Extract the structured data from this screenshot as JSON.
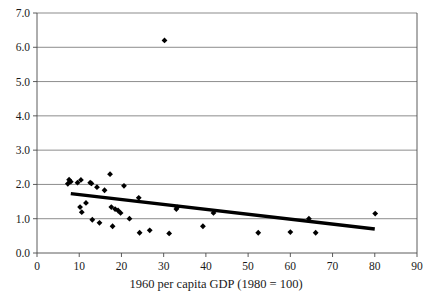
{
  "chart_data": {
    "type": "scatter",
    "title": "",
    "xlabel": "1960 per capita GDP (1980 = 100)",
    "ylabel": "",
    "xlim": [
      0,
      90
    ],
    "ylim": [
      0,
      7
    ],
    "xticks": [
      0,
      10,
      20,
      30,
      40,
      50,
      60,
      70,
      80,
      90
    ],
    "xtick_labels": [
      "0",
      "10",
      "20",
      "30",
      "40",
      "50",
      "60",
      "70",
      "80",
      "90"
    ],
    "yticks": [
      0,
      1,
      2,
      3,
      4,
      5,
      6,
      7
    ],
    "ytick_labels": [
      "0.0",
      "1.0",
      "2.0",
      "3.0",
      "4.0",
      "5.0",
      "6.0",
      "7.0"
    ],
    "grid": "horizontal",
    "legend": "none",
    "marker_style": "filled-diamond",
    "marker_color": "#000000",
    "points": [
      {
        "x": 7.3,
        "y": 2.02
      },
      {
        "x": 7.6,
        "y": 2.14
      },
      {
        "x": 8.0,
        "y": 2.08
      },
      {
        "x": 9.6,
        "y": 2.05
      },
      {
        "x": 10.4,
        "y": 2.13
      },
      {
        "x": 10.2,
        "y": 1.34
      },
      {
        "x": 10.6,
        "y": 1.19
      },
      {
        "x": 11.6,
        "y": 1.46
      },
      {
        "x": 12.6,
        "y": 2.05
      },
      {
        "x": 12.9,
        "y": 2.03
      },
      {
        "x": 13.1,
        "y": 0.97
      },
      {
        "x": 14.2,
        "y": 1.92
      },
      {
        "x": 14.8,
        "y": 0.88
      },
      {
        "x": 16.0,
        "y": 1.83
      },
      {
        "x": 17.3,
        "y": 2.3
      },
      {
        "x": 17.6,
        "y": 1.34
      },
      {
        "x": 17.9,
        "y": 0.78
      },
      {
        "x": 18.5,
        "y": 1.28
      },
      {
        "x": 19.2,
        "y": 1.24
      },
      {
        "x": 19.8,
        "y": 1.17
      },
      {
        "x": 20.6,
        "y": 1.96
      },
      {
        "x": 21.9,
        "y": 1.0
      },
      {
        "x": 24.1,
        "y": 1.61
      },
      {
        "x": 24.3,
        "y": 0.59
      },
      {
        "x": 26.7,
        "y": 0.66
      },
      {
        "x": 30.2,
        "y": 6.2
      },
      {
        "x": 31.3,
        "y": 0.57
      },
      {
        "x": 33.0,
        "y": 1.28
      },
      {
        "x": 33.2,
        "y": 1.33
      },
      {
        "x": 39.3,
        "y": 0.78
      },
      {
        "x": 41.8,
        "y": 1.17
      },
      {
        "x": 52.4,
        "y": 0.59
      },
      {
        "x": 60.0,
        "y": 0.61
      },
      {
        "x": 64.4,
        "y": 1.0
      },
      {
        "x": 66.0,
        "y": 0.59
      },
      {
        "x": 80.1,
        "y": 1.15
      }
    ],
    "trendline": {
      "x_start": 8.0,
      "y_start": 1.73,
      "x_end": 80.0,
      "y_end": 0.7,
      "color": "#000000"
    }
  }
}
